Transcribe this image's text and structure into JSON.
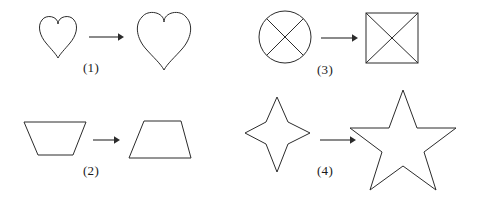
{
  "figure": {
    "type": "shape-transformation-diagram",
    "background_color": "#ffffff",
    "stroke_color": "#2b2b2b",
    "width": 477,
    "height": 206,
    "panels": [
      {
        "label": "(1)",
        "label_x": 89,
        "label_y": 60,
        "source_shape": "heart-small",
        "target_shape": "heart-large",
        "arrow": "right-arrow"
      },
      {
        "label": "(2)",
        "label_x": 88,
        "label_y": 163,
        "source_shape": "trapezoid-wide-top",
        "target_shape": "trapezoid-wide-bottom",
        "arrow": "right-arrow"
      },
      {
        "label": "(3)",
        "label_x": 322,
        "label_y": 62,
        "source_shape": "circle-with-x",
        "target_shape": "square-with-x",
        "arrow": "right-arrow"
      },
      {
        "label": "(4)",
        "label_x": 322,
        "label_y": 163,
        "source_shape": "star-4-point",
        "target_shape": "star-5-point",
        "arrow": "right-arrow"
      }
    ]
  }
}
